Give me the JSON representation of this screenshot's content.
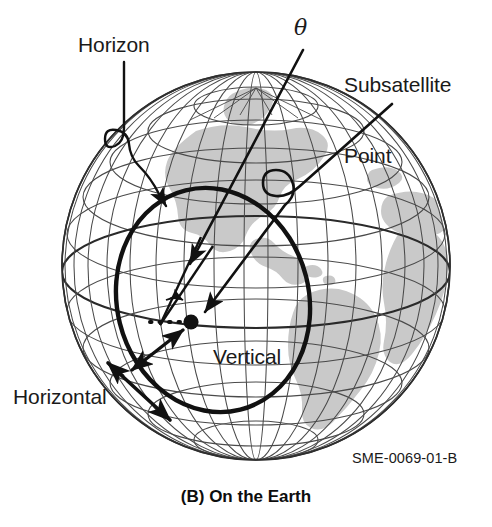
{
  "figure": {
    "caption": "(B) On the Earth",
    "reference_code": "SME-0069-01-B",
    "background_color": "#ffffff",
    "ink_color": "#111111",
    "land_color": "#c9c9c9",
    "graticule_color": "#5a5a5a"
  },
  "labels": {
    "horizon": "Horizon",
    "subsatellite_point": "Subsatellite\nPoint",
    "subsatellite_point_line1": "Subsatellite",
    "subsatellite_point_line2": "Point",
    "theta": "θ",
    "vertical": "Vertical",
    "horizontal": "Horizontal"
  },
  "globe": {
    "center_x": 256,
    "center_y": 266,
    "radius": 194,
    "parallel_count": 11,
    "meridian_count": 18,
    "land_masses": [
      "North America",
      "South America",
      "Africa",
      "Greenland"
    ]
  },
  "annotations": {
    "horizon_circle": {
      "name": "local horizon circle",
      "center_x": 213,
      "center_y": 300,
      "rx": 96,
      "ry": 113,
      "rotation_deg": -14,
      "stroke_width": 4.4
    },
    "subsatellite_dot": {
      "x": 190,
      "y": 322,
      "radius": 7.5
    },
    "angle_marker": {
      "label": "θ",
      "vertex_x": 160,
      "vertex_y": 325
    },
    "dotted_horizontal_segment": {
      "x1": 147,
      "y1": 322,
      "x2": 182,
      "y2": 322
    },
    "arrows": [
      {
        "name": "horizon-leader",
        "from": "Horizon label",
        "to": "globe horizon edge"
      },
      {
        "name": "subsatellite-leader",
        "from": "Subsatellite Point label",
        "to": "subsatellite dot"
      },
      {
        "name": "theta-leader",
        "from": "theta label",
        "to": "angle vertex"
      },
      {
        "name": "vertical-arrow",
        "from": "Vertical label",
        "to": "local vertical direction",
        "double_headed": true
      },
      {
        "name": "horizontal-arrow",
        "from": "Horizontal label",
        "to": "local horizontal direction",
        "double_headed": true
      }
    ]
  }
}
